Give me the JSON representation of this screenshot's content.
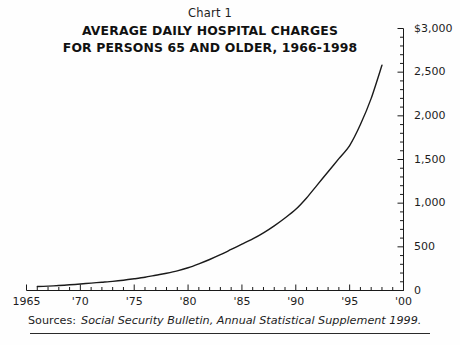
{
  "header": {
    "chart_number": "Chart 1",
    "title_line_1": "AVERAGE DAILY HOSPITAL CHARGES",
    "title_line_2": "FOR PERSONS 65 AND OLDER, 1966-1998"
  },
  "source": {
    "label": "Sources:",
    "text": "Social Security Bulletin, Annual Statistical Supplement 1999."
  },
  "colors": {
    "line": "#1a1a1a",
    "axis": "#1a1a1a",
    "text": "#1d1d1d",
    "background": "#fefefe"
  },
  "chart_data": {
    "type": "line",
    "title": "AVERAGE DAILY HOSPITAL CHARGES FOR PERSONS 65 AND OLDER, 1966-1998",
    "subtitle": "Chart 1",
    "xlabel": "",
    "ylabel": "",
    "xlim": [
      1965,
      2000
    ],
    "ylim": [
      0,
      3000
    ],
    "grid": false,
    "legend": false,
    "y_ticks": [
      0,
      500,
      1000,
      1500,
      2000,
      2500,
      3000
    ],
    "y_tick_labels": [
      "0",
      "500",
      "1,000",
      "1,500",
      "2,000",
      "2,500",
      "$3,000"
    ],
    "y_minor_tick_step": 100,
    "x_ticks": [
      1965,
      1970,
      1975,
      1980,
      1985,
      1990,
      1995,
      2000
    ],
    "x_tick_labels": [
      "1965",
      "'70",
      "'75",
      "'80",
      "'85",
      "'90",
      "'95",
      "'00"
    ],
    "x_minor_tick_step": 1,
    "series": [
      {
        "name": "Average daily hospital charges, persons 65 and older",
        "x": [
          1966,
          1967,
          1968,
          1969,
          1970,
          1971,
          1972,
          1973,
          1974,
          1975,
          1976,
          1977,
          1978,
          1979,
          1980,
          1981,
          1982,
          1983,
          1984,
          1985,
          1986,
          1987,
          1988,
          1989,
          1990,
          1991,
          1992,
          1993,
          1994,
          1995,
          1996,
          1997,
          1998
        ],
        "values": [
          45,
          50,
          57,
          65,
          74,
          85,
          95,
          105,
          118,
          134,
          152,
          175,
          198,
          225,
          260,
          305,
          355,
          410,
          470,
          530,
          590,
          660,
          740,
          830,
          930,
          1060,
          1210,
          1360,
          1510,
          1660,
          1900,
          2200,
          2580
        ]
      }
    ]
  }
}
